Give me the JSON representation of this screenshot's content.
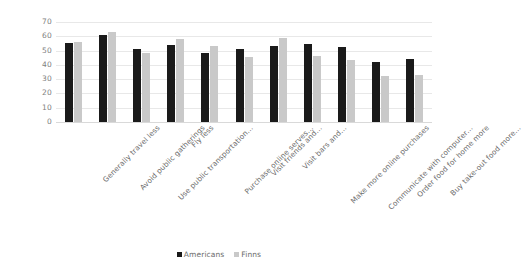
{
  "chart_data": {
    "type": "bar",
    "title": "",
    "subtitle": "",
    "xlabel": "",
    "ylabel": "",
    "ylim": [
      0,
      70
    ],
    "ytick_step": 10,
    "yticks": [
      "70",
      "60",
      "50",
      "40",
      "30",
      "20",
      "10",
      "0"
    ],
    "grid": true,
    "legend_position": "bottom-center",
    "orientation": "vertical",
    "grouping": "grouped",
    "xtick_rotation": -45,
    "categories": [
      "Generally travel less",
      "Avoid public gatherings",
      "Use public transportation…",
      "Fly less",
      "Purchase online serves…",
      "Visit friends and…",
      "Visit bars and…",
      "Make more online purchases",
      "Communicate with computer…",
      "Order food for home more",
      "Buy take-out food more…"
    ],
    "series": [
      {
        "name": "Americans",
        "color": "#1a1a1a",
        "values": [
          55,
          61,
          51,
          54,
          48.5,
          51,
          53,
          54.5,
          52.5,
          42,
          44
        ]
      },
      {
        "name": "Finns",
        "color": "#c9c9c9",
        "values": [
          56,
          63,
          48.5,
          58,
          53.5,
          45.5,
          59,
          46.5,
          43.5,
          32,
          33
        ]
      }
    ]
  },
  "legend": {
    "items": [
      {
        "label": "Americans",
        "color": "#1a1a1a"
      },
      {
        "label": "Finns",
        "color": "#c9c9c9"
      }
    ]
  },
  "colors": {
    "background": "#ffffff",
    "gridline": "#e8e8e8",
    "axis_text": "#808080",
    "label_text": "#6b6b6b",
    "series_americans": "#1a1a1a",
    "series_finns": "#c9c9c9"
  }
}
